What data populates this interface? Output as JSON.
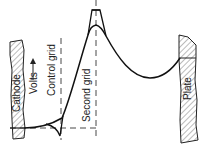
{
  "diagram": {
    "title": "",
    "electrodes": [
      {
        "id": "cathode",
        "label": "Cathode"
      },
      {
        "id": "plate",
        "label": "Plate"
      }
    ],
    "grid_labels": [
      {
        "id": "control-grid",
        "label": "Control grid"
      },
      {
        "id": "second-grid",
        "label": "Second grid"
      }
    ],
    "axis": {
      "label": "Volts",
      "arrow": "up"
    },
    "curves": [
      {
        "id": "potential-with-space-charge",
        "style": "solid"
      },
      {
        "id": "potential-grid-peak",
        "style": "solid"
      }
    ],
    "baseline": {
      "style": "dashed"
    }
  }
}
